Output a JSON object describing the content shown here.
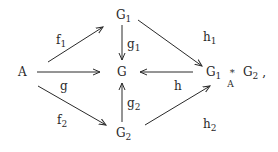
{
  "nodes": {
    "A": {
      "label": "A"
    },
    "G1": {
      "label": "G",
      "sub": "1"
    },
    "G": {
      "label": "G"
    },
    "G2": {
      "label": "G",
      "sub": "2"
    },
    "P": {
      "left": "G",
      "left_sub": "1",
      "op": "*",
      "op_sub": "A",
      "right": "G",
      "right_sub": "2",
      "trail": ","
    }
  },
  "arrows": {
    "f1": {
      "label": "f",
      "sub": "1"
    },
    "g": {
      "label": "g"
    },
    "f2": {
      "label": "f",
      "sub": "2"
    },
    "g1": {
      "label": "g",
      "sub": "1"
    },
    "g2": {
      "label": "g",
      "sub": "2"
    },
    "h1": {
      "label": "h",
      "sub": "1"
    },
    "h": {
      "label": "h"
    },
    "h2": {
      "label": "h",
      "sub": "2"
    }
  }
}
